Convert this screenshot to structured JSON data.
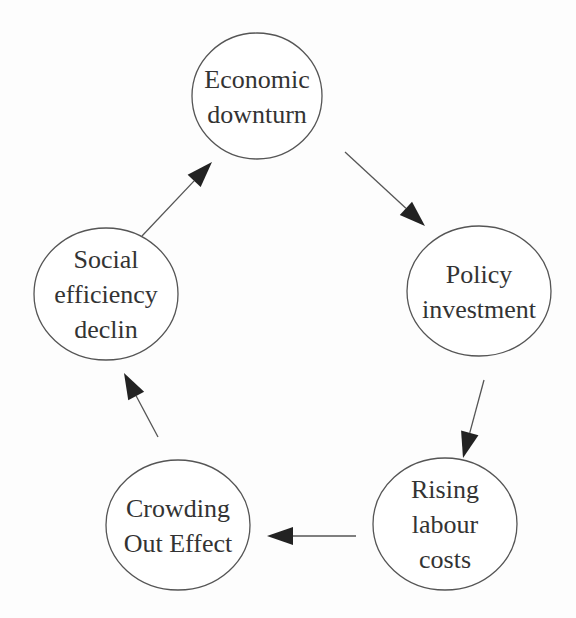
{
  "diagram": {
    "type": "cycle",
    "nodes": [
      {
        "id": "economic",
        "lines": [
          "Economic",
          "downturn"
        ],
        "cx": 257,
        "cy": 96,
        "rx": 65,
        "ry": 63
      },
      {
        "id": "policy",
        "lines": [
          "Policy",
          "investment"
        ],
        "cx": 479,
        "cy": 291,
        "rx": 72,
        "ry": 65
      },
      {
        "id": "labour",
        "lines": [
          "Rising",
          "labour",
          "costs"
        ],
        "cx": 445,
        "cy": 524,
        "rx": 72,
        "ry": 66
      },
      {
        "id": "crowding",
        "lines": [
          "Crowding",
          "Out Effect"
        ],
        "cx": 178,
        "cy": 525,
        "rx": 72,
        "ry": 65
      },
      {
        "id": "social",
        "lines": [
          "Social",
          "efficiency",
          "declin"
        ],
        "cx": 106,
        "cy": 294,
        "rx": 72,
        "ry": 66
      }
    ],
    "edges": [
      {
        "from": "economic",
        "to": "policy",
        "x1": 345,
        "y1": 152,
        "x2": 425,
        "y2": 226
      },
      {
        "from": "policy",
        "to": "labour",
        "x1": 484,
        "y1": 380,
        "x2": 463,
        "y2": 458
      },
      {
        "from": "labour",
        "to": "crowding",
        "x1": 356,
        "y1": 536,
        "x2": 267,
        "y2": 536
      },
      {
        "from": "crowding",
        "to": "social",
        "x1": 158,
        "y1": 437,
        "x2": 124,
        "y2": 373
      },
      {
        "from": "social",
        "to": "economic",
        "x1": 142,
        "y1": 236,
        "x2": 212,
        "y2": 162
      }
    ]
  }
}
